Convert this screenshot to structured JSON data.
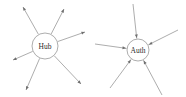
{
  "figure": {
    "background_color": "#ffffff",
    "line_color": "#8a8a8a",
    "arrow_color": "#6f6f6f",
    "label_color": "#2b2b2b",
    "node_fill": "#ffffff",
    "width": 186,
    "height": 97
  },
  "diagrams": [
    {
      "id": "hub-fan-out",
      "center_label": "Hub",
      "center": {
        "x": 45,
        "y": 46,
        "r": 13
      },
      "arrow_direction": "outward",
      "spoke_count": 6,
      "spokes": [
        {
          "id": "spoke-hub-1",
          "label": "",
          "end": {
            "x": 23,
            "y": 7
          }
        },
        {
          "id": "spoke-hub-2",
          "label": "",
          "end": {
            "x": 64,
            "y": 9
          }
        },
        {
          "id": "spoke-hub-3",
          "label": "",
          "end": {
            "x": 85,
            "y": 32
          }
        },
        {
          "id": "spoke-hub-4",
          "label": "",
          "end": {
            "x": 13,
            "y": 60
          }
        },
        {
          "id": "spoke-hub-5",
          "label": "",
          "end": {
            "x": 26,
            "y": 90
          }
        },
        {
          "id": "spoke-hub-6",
          "label": "",
          "end": {
            "x": 81,
            "y": 84
          }
        }
      ]
    },
    {
      "id": "auth-fan-in",
      "center_label": "Auth",
      "center": {
        "x": 138,
        "y": 50,
        "r": 11
      },
      "arrow_direction": "inward",
      "spoke_count": 5,
      "spokes": [
        {
          "id": "spoke-auth-1",
          "label": "",
          "end": {
            "x": 133,
            "y": 4
          }
        },
        {
          "id": "spoke-auth-2",
          "label": "",
          "end": {
            "x": 178,
            "y": 30
          }
        },
        {
          "id": "spoke-auth-3",
          "label": "",
          "end": {
            "x": 95,
            "y": 44
          }
        },
        {
          "id": "spoke-auth-4",
          "label": "",
          "end": {
            "x": 110,
            "y": 88
          }
        },
        {
          "id": "spoke-auth-5",
          "label": "",
          "end": {
            "x": 162,
            "y": 95
          }
        }
      ]
    }
  ]
}
